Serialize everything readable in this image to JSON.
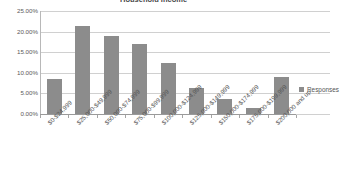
{
  "chart_data": {
    "type": "bar",
    "title": "Household Income",
    "categories": [
      "$0-$24,999",
      "$25,000-$49,999",
      "$50,000-$74,999",
      "$75,000-$99,999",
      "$100,000-$124,999",
      "$125,000-$149,999",
      "$150,000-$174,999",
      "$175,000-$199,999",
      "$200,000 and up"
    ],
    "series": [
      {
        "name": "Responses",
        "values": [
          8.6,
          21.3,
          18.9,
          17.1,
          12.4,
          6.4,
          3.7,
          1.4,
          9.0
        ]
      }
    ],
    "values": [
      8.6,
      21.3,
      18.9,
      17.1,
      12.4,
      6.4,
      3.7,
      1.4,
      9.0
    ],
    "ytick_labels": [
      "0.00%",
      "5.00%",
      "10.00%",
      "15.00%",
      "20.00%",
      "25.00%"
    ],
    "ytick_values": [
      0,
      5,
      10,
      15,
      20,
      25
    ],
    "ylim": [
      0,
      25
    ],
    "xlabel": "",
    "ylabel": "",
    "grid": true,
    "legend_position": "right",
    "colors": {
      "bar": "#8c8c8c",
      "gridline": "#d0d0d0",
      "axis": "#9a9a9a",
      "text": "#555555",
      "background": "#ffffff"
    }
  },
  "legend": {
    "entries": [
      {
        "label": "Responses",
        "marker": "square-swatch"
      }
    ]
  }
}
